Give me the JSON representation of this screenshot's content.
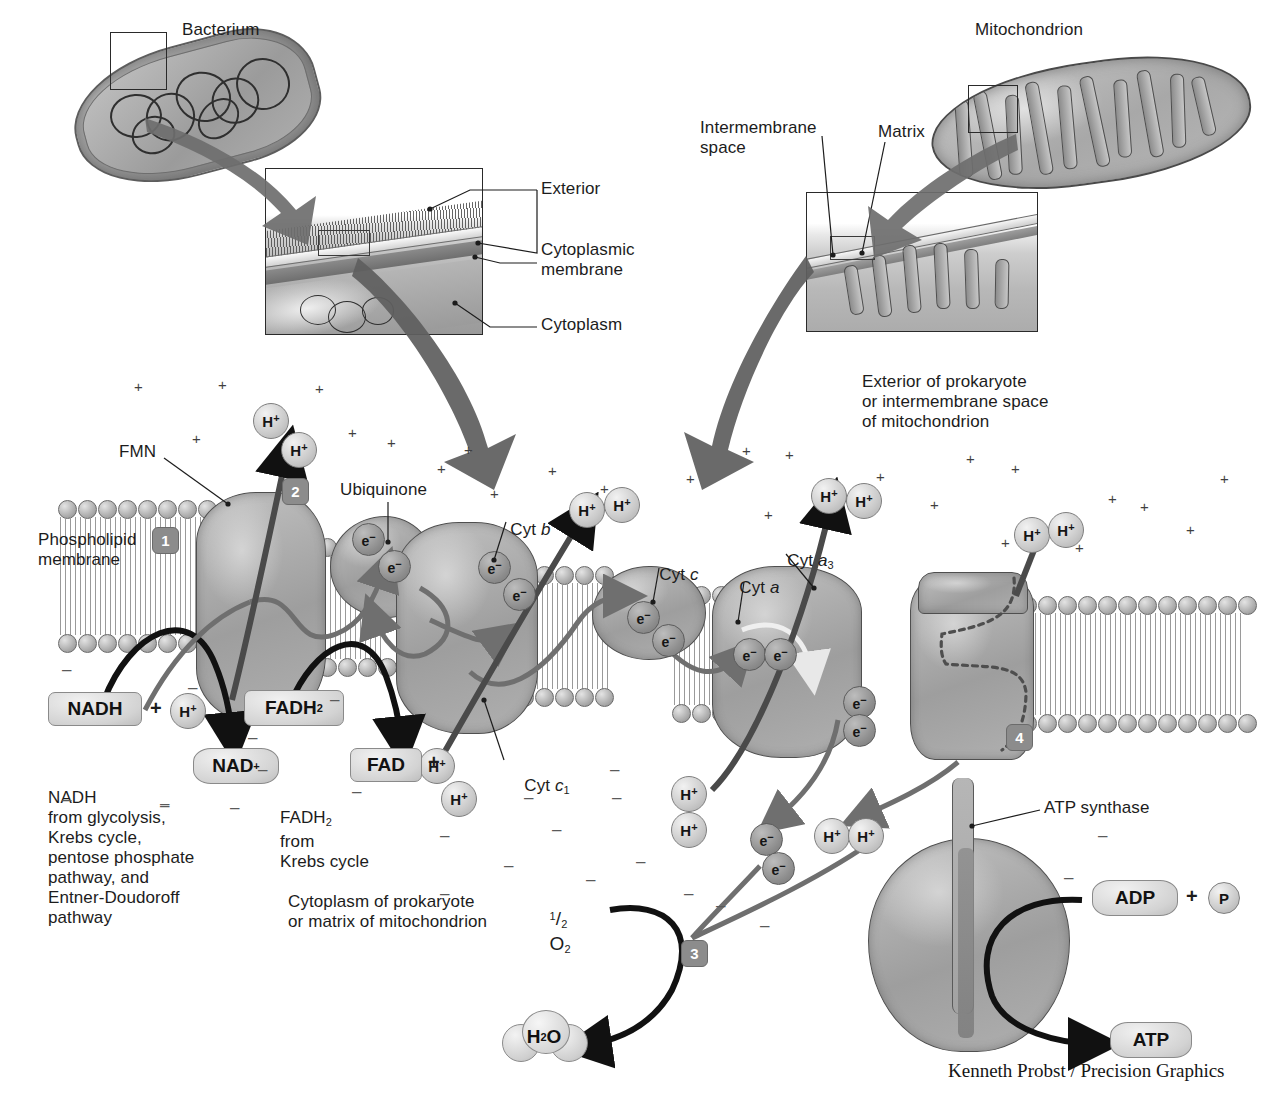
{
  "credit": "Kenneth Probst / Precision Graphics",
  "top_panels": {
    "bacterium_label": "Bacterium",
    "mitochondrion_label": "Mitochondrion",
    "bacterium_callouts": [
      {
        "label": "Exterior"
      },
      {
        "label": "Cytoplasmic\nmembrane"
      },
      {
        "label": "Cytoplasm"
      }
    ],
    "mitochondrion_callouts": [
      {
        "label": "Intermembrane\nspace"
      },
      {
        "label": "Matrix"
      }
    ],
    "compartment_note": "Exterior of prokaryote\nor intermembrane space\nof mitochondrion"
  },
  "membrane": {
    "phospholipid_label": "Phospholipid\nmembrane",
    "cytoplasm_note": "Cytoplasm of prokaryote\nor matrix of mitochondrion"
  },
  "complex_labels": [
    {
      "name": "fmn",
      "text": "FMN"
    },
    {
      "name": "ubiquinone",
      "text": "Ubiquinone"
    },
    {
      "name": "cyt-b",
      "text": "Cyt b",
      "italic_part": "b"
    },
    {
      "name": "cyt-c1",
      "text": "Cyt c",
      "subscript": "1"
    },
    {
      "name": "cyt-c",
      "text": "Cyt c",
      "italic_part": "c"
    },
    {
      "name": "cyt-a",
      "text": "Cyt a",
      "italic_part": "a"
    },
    {
      "name": "cyt-a3",
      "text": "Cyt a",
      "subscript": "3"
    },
    {
      "name": "atp-synthase",
      "text": "ATP synthase"
    }
  ],
  "labels": {
    "fmn": "FMN",
    "ubiquinone": "Ubiquinone",
    "cyt_b_prefix": "Cyt ",
    "cyt_b_italic": "b",
    "cyt_c1_prefix": "Cyt ",
    "cyt_c1_italic": "c",
    "cyt_c1_sub": "1",
    "cyt_c_prefix": "Cyt ",
    "cyt_c_italic": "c",
    "cyt_a_prefix": "Cyt ",
    "cyt_a_italic": "a",
    "cyt_a3_prefix": "Cyt ",
    "cyt_a3_italic": "a",
    "cyt_a3_sub": "3",
    "atp_synthase": "ATP synthase"
  },
  "molecules": {
    "nadh": "NADH",
    "nadh_plus": "+",
    "nad_plus_base": "NAD",
    "nad_plus_sup": "+",
    "fadh2_base": "FADH",
    "fadh2_sub": "2",
    "fad": "FAD",
    "fad_plus": "+",
    "adp": "ADP",
    "adp_plus": "+",
    "phosphate": "P",
    "atp": "ATP",
    "water_base": "H",
    "water_sub": "2",
    "water_tail": "O",
    "half_o2_num": "1",
    "half_o2_den": "2",
    "half_o2_base": "O",
    "half_o2_sub": "2",
    "proton": "H",
    "proton_sup": "+",
    "electron": "e",
    "electron_sup": "−"
  },
  "source_notes": {
    "nadh_sources": "NADH\nfrom glycolysis,\nKrebs cycle,\npentose phosphate\npathway, and\nEntner-Doudoroff\npathway",
    "fadh2_sources_base": "FADH",
    "fadh2_sources_sub": "2",
    "fadh2_sources_rest": "\nfrom\nKrebs cycle"
  },
  "step_badges": [
    {
      "number": "1"
    },
    {
      "number": "2"
    },
    {
      "number": "3"
    },
    {
      "number": "4"
    }
  ],
  "proton_bubbles": [
    {
      "x": 253,
      "y": 403
    },
    {
      "x": 281,
      "y": 432
    },
    {
      "x": 569,
      "y": 492
    },
    {
      "x": 602,
      "y": 487
    },
    {
      "x": 811,
      "y": 478
    },
    {
      "x": 845,
      "y": 483
    },
    {
      "x": 1015,
      "y": 517
    },
    {
      "x": 1047,
      "y": 513
    },
    {
      "x": 419,
      "y": 748
    },
    {
      "x": 441,
      "y": 780
    },
    {
      "x": 671,
      "y": 775
    },
    {
      "x": 671,
      "y": 810
    },
    {
      "x": 815,
      "y": 818
    },
    {
      "x": 847,
      "y": 818
    },
    {
      "x": 160,
      "y": 697
    }
  ],
  "electron_bubbles": [
    {
      "x": 352,
      "y": 523
    },
    {
      "x": 378,
      "y": 550
    },
    {
      "x": 478,
      "y": 551
    },
    {
      "x": 503,
      "y": 578
    },
    {
      "x": 627,
      "y": 601
    },
    {
      "x": 652,
      "y": 624
    },
    {
      "x": 733,
      "y": 638
    },
    {
      "x": 763,
      "y": 638
    },
    {
      "x": 843,
      "y": 685
    },
    {
      "x": 843,
      "y": 713
    },
    {
      "x": 752,
      "y": 823
    },
    {
      "x": 763,
      "y": 851
    }
  ],
  "colors": {
    "ink": "#1c1c1c",
    "membrane_gray": "#9e9e9e",
    "badge_gray": "#8c8c8c",
    "arrow_dark": "#111111",
    "arrow_gray": "#6f6f6f",
    "page_bg": "#ffffff"
  }
}
